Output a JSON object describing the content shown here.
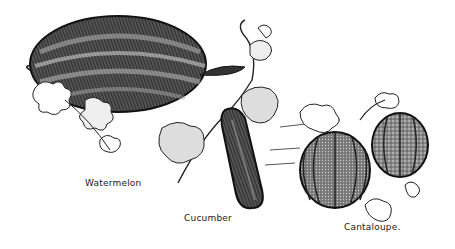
{
  "illustration": {
    "style": "vintage botanical engraving",
    "colors": {
      "ink": "#1a1a1a",
      "paper": "#ffffff",
      "mid": "#777777"
    },
    "items": [
      {
        "name": "watermelon",
        "label": "Watermelon"
      },
      {
        "name": "cucumber",
        "label": "Cucumber"
      },
      {
        "name": "cantaloupe",
        "label": "Cantaloupe."
      }
    ]
  }
}
